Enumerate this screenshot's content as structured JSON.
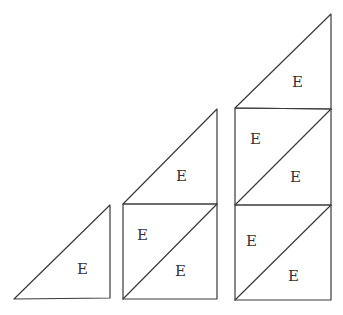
{
  "diagram": {
    "label_glyph": "E",
    "stroke_color": "#3a3a3a",
    "background": "#ffffff",
    "figures": [
      {
        "name": "figure-1",
        "triangle_count": 1,
        "labels": [
          {
            "text": "E",
            "x": 82,
            "y": 274
          }
        ]
      },
      {
        "name": "figure-2",
        "triangle_count": 3,
        "labels": [
          {
            "text": "E",
            "x": 181,
            "y": 181
          },
          {
            "text": "E",
            "x": 144,
            "y": 240
          },
          {
            "text": "E",
            "x": 181,
            "y": 276
          }
        ]
      },
      {
        "name": "figure-3",
        "triangle_count": 5,
        "labels": [
          {
            "text": "E",
            "x": 297,
            "y": 87
          },
          {
            "text": "E",
            "x": 256,
            "y": 144
          },
          {
            "text": "E",
            "x": 297,
            "y": 182
          },
          {
            "text": "E",
            "x": 252,
            "y": 246
          },
          {
            "text": "E",
            "x": 294,
            "y": 281
          }
        ]
      }
    ]
  }
}
